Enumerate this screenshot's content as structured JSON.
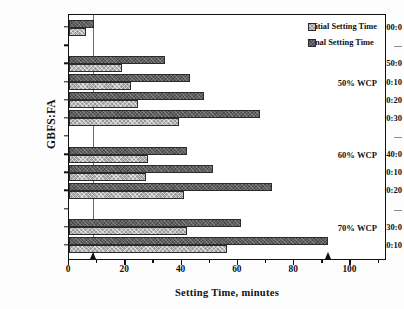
{
  "chart_data": {
    "type": "bar",
    "orientation": "horizontal",
    "title": "",
    "xlabel": "Setting Time, minutes",
    "ylabel": "GBFS:FA",
    "xlim": [
      0,
      113
    ],
    "xticks": [
      0,
      20,
      40,
      60,
      80,
      100
    ],
    "xtick_labels": [
      "0",
      "20",
      "40",
      "60",
      "80",
      "100"
    ],
    "minor_tick_step": 10,
    "grid": false,
    "legend_position": "top-right",
    "categories": [
      "100:0",
      "50:0",
      "40:10",
      "30:20",
      "20:30",
      "40:0",
      "30:10",
      "20:20",
      "30:0",
      "20:10"
    ],
    "series": [
      {
        "name": "Initial Setting Time",
        "values": [
          6,
          19,
          22,
          24.5,
          39,
          28,
          27.5,
          41,
          42,
          56
        ]
      },
      {
        "name": "Final Setting Time",
        "values": [
          9,
          34,
          43,
          48,
          68,
          42,
          51,
          72,
          61,
          92
        ]
      }
    ],
    "annotations": [
      {
        "text": "50% WCP",
        "category_anchor": "40:10"
      },
      {
        "text": "60% WCP",
        "category_anchor": "40:0"
      },
      {
        "text": "70% WCP",
        "category_anchor": "30:0"
      }
    ],
    "reference_line_x": 8.5,
    "arrow_markers_x": [
      8.5,
      92
    ]
  },
  "axes": {
    "y_title": "GBFS:FA",
    "x_title": "Setting Time, minutes",
    "y_tick_labels": [
      {
        "label": "100:0",
        "type": "category"
      },
      {
        "label": "—",
        "type": "separator"
      },
      {
        "label": "50:0",
        "type": "category"
      },
      {
        "label": "40:10",
        "type": "category"
      },
      {
        "label": "30:20",
        "type": "category"
      },
      {
        "label": "20:30",
        "type": "category"
      },
      {
        "label": "—",
        "type": "separator"
      },
      {
        "label": "40:0",
        "type": "category"
      },
      {
        "label": "30:10",
        "type": "category"
      },
      {
        "label": "20:20",
        "type": "category"
      },
      {
        "label": "—",
        "type": "separator"
      },
      {
        "label": "30:0",
        "type": "category"
      },
      {
        "label": "20:10",
        "type": "category"
      }
    ],
    "x_tick_labels": [
      "0",
      "20",
      "40",
      "60",
      "80",
      "100"
    ]
  },
  "legend": {
    "items": [
      {
        "label": "Initial Setting Time",
        "pattern": "light-crosshatch",
        "color": "#9a9a9a"
      },
      {
        "label": "Final Setting Time",
        "pattern": "dark-crosshatch",
        "color": "#5d5d5d"
      }
    ]
  },
  "annotations": {
    "group_50": "50% WCP",
    "group_60": "60% WCP",
    "group_70": "70% WCP"
  },
  "colors": {
    "initial_bar": "#9a9a9a",
    "final_bar": "#5d5d5d",
    "axis": "#111111",
    "reference_line": "#6a6a6a",
    "background": "#ffffff"
  }
}
